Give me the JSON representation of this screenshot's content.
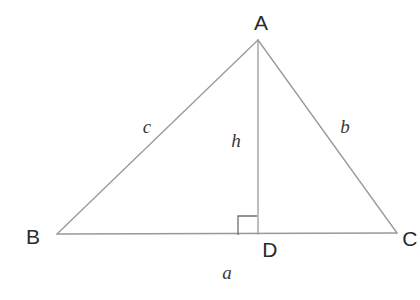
{
  "figure": {
    "kind": "geometry-diagram",
    "background_color": "#ffffff",
    "line_color": "#999999",
    "line_width": 1.3,
    "vertex_label_color": "#2b2b2b",
    "side_label_color": "#3a3a3a"
  },
  "vertices": {
    "A": {
      "label": "A",
      "x": 258,
      "y": 40,
      "label_x": 261,
      "label_y": 22
    },
    "B": {
      "label": "B",
      "x": 57,
      "y": 234,
      "label_x": 33,
      "label_y": 236
    },
    "C": {
      "label": "C",
      "x": 397,
      "y": 233,
      "label_x": 410,
      "label_y": 238
    },
    "D": {
      "label": "D",
      "x": 258,
      "y": 234,
      "label_x": 270,
      "label_y": 249
    }
  },
  "segments": {
    "AB": {
      "label": "c",
      "from": "A",
      "to": "B",
      "label_x": 147,
      "label_y": 126
    },
    "AC": {
      "label": "b",
      "from": "A",
      "to": "C",
      "label_x": 345,
      "label_y": 126
    },
    "BC": {
      "label": "a",
      "from": "B",
      "to": "C",
      "label_x": 227,
      "label_y": 272
    },
    "AD": {
      "label": "h",
      "from": "A",
      "to": "D",
      "label_x": 236,
      "label_y": 140
    }
  },
  "right_angle_marker": {
    "at_vertex": "D",
    "x": 238,
    "y": 216,
    "size": 19
  }
}
